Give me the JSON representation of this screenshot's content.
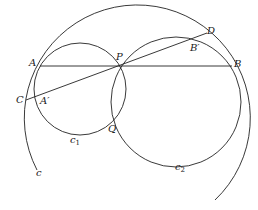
{
  "diagram": {
    "type": "geometry",
    "stroke_color": "#222222",
    "circles": [
      {
        "name": "c",
        "label": "c",
        "cx": 135,
        "cy": 127,
        "r": 113
      },
      {
        "name": "c1",
        "label": "c",
        "subscript": "1",
        "cx": 80,
        "cy": 89,
        "r": 46
      },
      {
        "name": "c2",
        "label": "c",
        "subscript": "2",
        "cx": 176,
        "cy": 102,
        "r": 65
      }
    ],
    "points": {
      "A": {
        "label": "A",
        "x": 40,
        "y": 66
      },
      "P": {
        "label": "P",
        "x": 120,
        "y": 66
      },
      "B": {
        "label": "B",
        "x": 232,
        "y": 66
      },
      "C": {
        "label": "C",
        "x": 26,
        "y": 100
      },
      "A_prime": {
        "label": "A′",
        "x": 40,
        "y": 96
      },
      "D": {
        "label": "D",
        "x": 207,
        "y": 33
      },
      "B_prime": {
        "label": "B′",
        "x": 193,
        "y": 41
      },
      "Q": {
        "label": "Q",
        "x": 115,
        "y": 119
      }
    },
    "segments": [
      {
        "name": "AB",
        "from": "A",
        "to": "B"
      },
      {
        "name": "CD",
        "from": "C",
        "to": "D"
      }
    ]
  }
}
